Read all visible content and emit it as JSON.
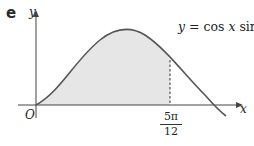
{
  "part_label": "e",
  "axes": {
    "x_label": "x",
    "y_label": "y",
    "origin_label": "O"
  },
  "equation": {
    "lhs": "y",
    "eq": " = cos ",
    "var": "x",
    "fn": " sin",
    "sup": "2",
    "var2": "x"
  },
  "marker": {
    "numerator": "5π",
    "denominator": "12"
  },
  "colors": {
    "curve": "#555555",
    "fill": "#e6e6e6",
    "axis": "#444444"
  }
}
